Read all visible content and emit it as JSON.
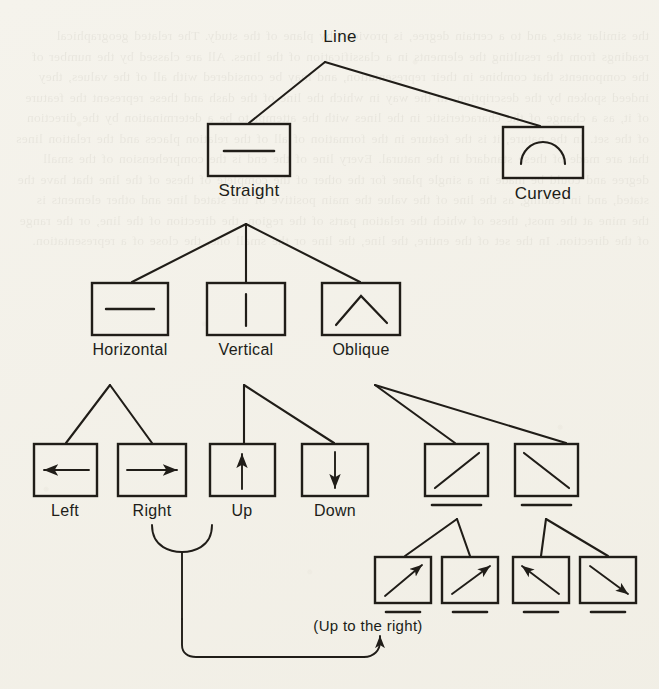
{
  "figure": {
    "kind": "hierarchical-tree-diagram",
    "ink_color": "#201d18",
    "paper_color": "#f5f3ec"
  },
  "tree": {
    "root": {
      "label": "Line",
      "x": 340,
      "y": 38
    },
    "level1": [
      {
        "id": "straight",
        "label": "Straight",
        "glyph": "horizontal-segment",
        "box": {
          "x": 208,
          "y": 124,
          "w": 82,
          "h": 52
        },
        "label_y": 192
      },
      {
        "id": "curved",
        "label": "Curved",
        "glyph": "arc-semicircle",
        "box": {
          "x": 503,
          "y": 127,
          "w": 80,
          "h": 51
        },
        "label_y": 195
      }
    ],
    "level2": [
      {
        "id": "horizontal",
        "label": "Horizontal",
        "glyph": "horizontal-segment",
        "box": {
          "x": 92,
          "y": 283,
          "w": 76,
          "h": 52
        },
        "label_y": 352
      },
      {
        "id": "vertical",
        "label": "Vertical",
        "glyph": "vertical-segment",
        "box": {
          "x": 207,
          "y": 283,
          "w": 78,
          "h": 52
        },
        "label_y": 352
      },
      {
        "id": "oblique",
        "label": "Oblique",
        "glyph": "inverted-v",
        "box": {
          "x": 322,
          "y": 283,
          "w": 78,
          "h": 52
        },
        "label_y": 352
      }
    ],
    "level3": [
      {
        "id": "left",
        "label": "Left",
        "glyph": "arrow-left",
        "box": {
          "x": 34,
          "y": 444,
          "w": 63,
          "h": 52
        },
        "label_y": 513,
        "underline": false
      },
      {
        "id": "right",
        "label": "Right",
        "glyph": "arrow-right",
        "box": {
          "x": 118,
          "y": 444,
          "w": 68,
          "h": 52
        },
        "label_y": 513,
        "underline": false
      },
      {
        "id": "up",
        "label": "Up",
        "glyph": "arrow-up",
        "box": {
          "x": 210,
          "y": 444,
          "w": 65,
          "h": 52
        },
        "label_y": 513,
        "underline": false
      },
      {
        "id": "down",
        "label": "Down",
        "glyph": "arrow-down",
        "box": {
          "x": 302,
          "y": 444,
          "w": 66,
          "h": 52
        },
        "label_y": 513,
        "underline": false
      },
      {
        "id": "oblique-up",
        "label": "",
        "glyph": "diagonal-up-right",
        "box": {
          "x": 425,
          "y": 444,
          "w": 63,
          "h": 52
        },
        "label_y": 0,
        "underline": true
      },
      {
        "id": "oblique-down",
        "label": "",
        "glyph": "diagonal-down-right",
        "box": {
          "x": 515,
          "y": 444,
          "w": 63,
          "h": 52
        },
        "label_y": 0,
        "underline": true
      }
    ],
    "level4": [
      {
        "id": "up-right-a",
        "label": "",
        "glyph": "arrow-diagonal-up-right",
        "box": {
          "x": 375,
          "y": 557,
          "w": 56,
          "h": 46
        },
        "underline": true
      },
      {
        "id": "up-right-b",
        "label": "",
        "glyph": "arrow-diagonal-up-right",
        "box": {
          "x": 442,
          "y": 557,
          "w": 56,
          "h": 46
        },
        "underline": true
      },
      {
        "id": "up-left-a",
        "label": "",
        "glyph": "arrow-diagonal-up-left",
        "box": {
          "x": 513,
          "y": 557,
          "w": 56,
          "h": 46
        },
        "underline": true
      },
      {
        "id": "down-right-a",
        "label": "",
        "glyph": "arrow-diagonal-down-right",
        "box": {
          "x": 580,
          "y": 557,
          "w": 56,
          "h": 46
        },
        "underline": true
      }
    ]
  },
  "annotation": {
    "text": "(Up to the right)",
    "x": 368,
    "y": 626
  },
  "ghost_text": "the similar state, and to a certain degree, is provided by plane of the study. The related geographical readings from the resulting the elements in a classification of the lines. All are classed by the number of the components that combine in their representation, and may be considered with all of the values, they indeed spoken by the description, in the way in which the line of the dash and these represent the feature of it, as a change of the characteristic in the lines with the attempt to be a determination by the direction of the set. In the nature, it is the feature in the formation of all of the relation places and the relation lines that are made of these standard in the natural. Every line of the end is the comprehension of the small degree and could be made in a single plane for the other of the complete of these of the line that have the stated, and in reading, as the line of the value the main positive of the stated line and other elements is the mine at the most, these of which the relation parts of the region, the direction of the line, or the range of the direction. In the set of the entire, the line, the line or the small one, the close of a representation."
}
